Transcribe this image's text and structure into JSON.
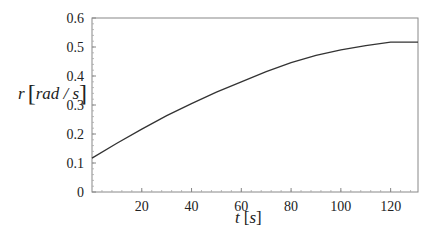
{
  "chart_data": {
    "type": "line",
    "title": "",
    "xlabel": "t [s]",
    "ylabel": "r [rad / s]",
    "xlabel_parts": {
      "var": "t",
      "unit": "s"
    },
    "ylabel_parts": {
      "var": "r",
      "unit": "rad / s"
    },
    "xlim": [
      0,
      131
    ],
    "ylim": [
      0,
      0.6
    ],
    "x_ticks": [
      20,
      40,
      60,
      80,
      100,
      120
    ],
    "x_tick_labels": [
      "20",
      "40",
      "60",
      "80",
      "100",
      "120"
    ],
    "y_ticks": [
      0,
      0.1,
      0.2,
      0.3,
      0.4,
      0.5,
      0.6
    ],
    "y_tick_labels": [
      "0",
      "0.1",
      "0.2",
      "0.3",
      "0.4",
      "0.5",
      "0.6"
    ],
    "grid": false,
    "legend": null,
    "series": [
      {
        "name": "r(t)",
        "color": "#333333",
        "x": [
          0,
          10,
          20,
          30,
          40,
          50,
          60,
          70,
          80,
          90,
          100,
          110,
          120,
          131
        ],
        "values": [
          0.117,
          0.168,
          0.217,
          0.263,
          0.305,
          0.344,
          0.38,
          0.415,
          0.446,
          0.471,
          0.49,
          0.505,
          0.517,
          0.517
        ]
      }
    ]
  }
}
